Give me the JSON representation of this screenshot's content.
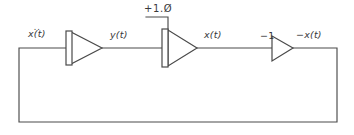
{
  "diagram": {
    "style": "hand-drawn pen sketch on white paper",
    "ink_color": "#4a4a4a",
    "text_color": "#39393b",
    "background_color": "#ffffff"
  },
  "labels": {
    "input_signal": "x(t)",
    "input_signal_accent": "..",
    "input_signal_full": "ẍ(t)",
    "intermediate_signal": "y(t)",
    "output_signal": "x(t)",
    "inverted_signal": "−x(t)",
    "initial_condition": "+1.Ø",
    "inverter_gain": "−1"
  },
  "blocks": [
    {
      "id": "integrator-1",
      "type": "integrator",
      "input_label": "ẍ(t)",
      "output_label": "y(t)",
      "has_input_bar": true,
      "has_ic_input": false
    },
    {
      "id": "integrator-2",
      "type": "integrator",
      "input_label": "y(t)",
      "output_label": "x(t)",
      "has_input_bar": true,
      "has_ic_input": true,
      "ic_value": "+1.Ø"
    },
    {
      "id": "inverter-1",
      "type": "inverter",
      "input_label": "−1",
      "output_label": "−x(t)",
      "has_input_bar": false,
      "has_ic_input": false
    }
  ],
  "connections": [
    {
      "id": "feedback-loop",
      "from": "inverter-1-output",
      "to": "integrator-1-input",
      "path": "right-down-left-up"
    },
    {
      "id": "wire-in-to-int1",
      "from": "feedback-left-corner",
      "to": "integrator-1-input"
    },
    {
      "id": "wire-int1-to-int2",
      "from": "integrator-1-output",
      "to": "integrator-2-input"
    },
    {
      "id": "wire-int2-to-inv",
      "from": "integrator-2-output",
      "to": "inverter-1-input"
    },
    {
      "id": "wire-ic-drop",
      "from": "initial-condition-label",
      "to": "integrator-2-top"
    }
  ]
}
